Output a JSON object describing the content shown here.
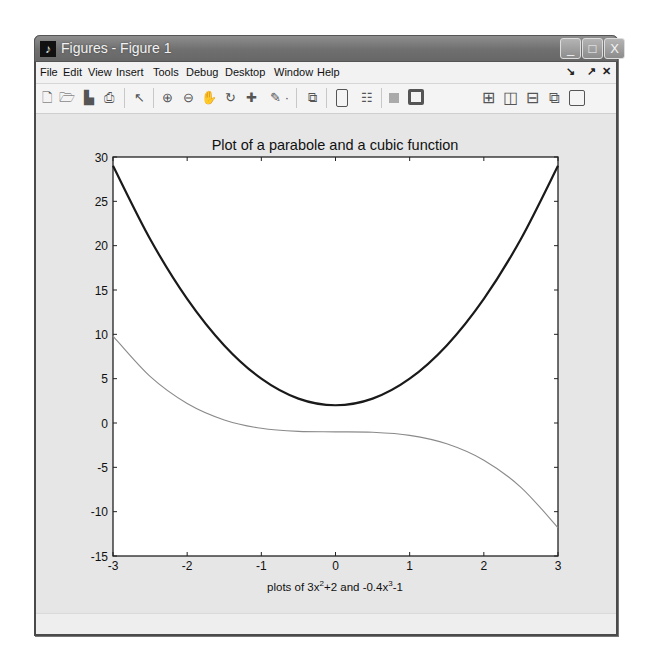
{
  "window": {
    "title": "Figures - Figure 1",
    "app_icon": "matlab-logo-icon",
    "buttons": {
      "minimize": "_",
      "maximize": "□",
      "close": "X"
    }
  },
  "menubar": {
    "items": [
      "File",
      "Edit",
      "View",
      "Insert",
      "Tools",
      "Debug",
      "Desktop",
      "Window",
      "Help"
    ],
    "right_icons": [
      "undock-icon",
      "dock-icon",
      "close-icon"
    ]
  },
  "toolbar": {
    "icons": [
      "new-figure-icon",
      "open-file-icon",
      "save-icon",
      "print-icon",
      "edit-plot-arrow-icon",
      "zoom-in-icon",
      "zoom-out-icon",
      "pan-hand-icon",
      "rotate-3d-icon",
      "data-cursor-icon",
      "brush-icon",
      "brush-dropdown-icon",
      "link-plot-icon",
      "hide-plot-tools-icon",
      "show-plot-tools-icon",
      "insert-colorbar-icon",
      "insert-legend-icon",
      "tile-grid-icon",
      "tile-left-right-icon",
      "tile-top-bottom-icon",
      "float-icon",
      "maximize-icon"
    ]
  },
  "chart_data": {
    "type": "line",
    "title": "Plot of a parabole and a cubic function",
    "xlabel": "plots of 3x^2+2 and -0.4x^3-1",
    "xlabel_parts": {
      "p1": "plots of 3x",
      "sup1": "2",
      "p2": "+2 and -0.4x",
      "sup2": "3",
      "p3": "-1"
    },
    "ylabel": "",
    "xlim": [
      -3,
      3
    ],
    "ylim": [
      -15,
      30
    ],
    "xticks": [
      -3,
      -2,
      -1,
      0,
      1,
      2,
      3
    ],
    "yticks": [
      -15,
      -10,
      -5,
      0,
      5,
      10,
      15,
      20,
      25,
      30
    ],
    "grid": false,
    "legend": null,
    "x": [
      -3,
      -2.5,
      -2,
      -1.5,
      -1,
      -0.5,
      0,
      0.5,
      1,
      1.5,
      2,
      2.5,
      3
    ],
    "series": [
      {
        "name": "3x^2+2",
        "color": "#1a1a1a",
        "width": 2.2,
        "values": [
          29,
          20.75,
          14,
          8.75,
          5,
          2.75,
          2,
          2.75,
          5,
          8.75,
          14,
          20.75,
          29
        ]
      },
      {
        "name": "-0.4x^3-1",
        "color": "#8a8a8a",
        "width": 1.1,
        "values": [
          9.8,
          5.25,
          2.2,
          0.35,
          -0.6,
          -0.95,
          -1,
          -1.05,
          -1.4,
          -2.35,
          -4.2,
          -7.25,
          -11.8
        ]
      }
    ]
  }
}
